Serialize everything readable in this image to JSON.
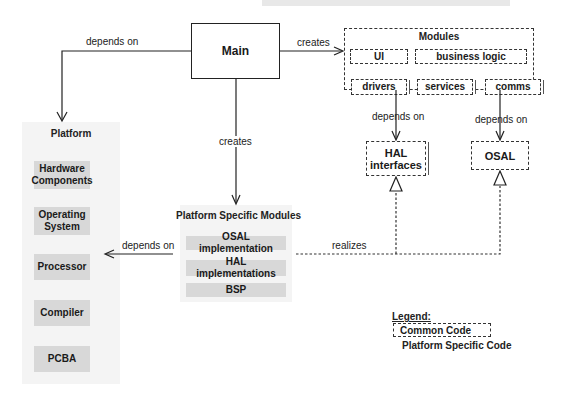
{
  "diagram": {
    "main": {
      "label": "Main"
    },
    "modules": {
      "title": "Modules",
      "items": [
        "UI",
        "business logic",
        "drivers",
        "services",
        "comms"
      ]
    },
    "hal_interfaces": {
      "label": "HAL\ninterfaces",
      "line1": "HAL",
      "line2": "interfaces"
    },
    "osal": {
      "label": "OSAL"
    },
    "platform": {
      "title": "Platform",
      "items": [
        {
          "line1": "Hardware",
          "line2": "Components"
        },
        {
          "line1": "Operating",
          "line2": "System"
        },
        {
          "line1": "Processor",
          "line2": ""
        },
        {
          "line1": "Compiler",
          "line2": ""
        },
        {
          "line1": "PCBA",
          "line2": ""
        }
      ]
    },
    "platform_specific": {
      "title": "Platform Specific Modules",
      "items": [
        "OSAL implementation",
        "HAL implementations",
        "BSP"
      ]
    },
    "edges": {
      "main_platform": "depends on",
      "main_modules": "creates",
      "main_psm": "creates",
      "psm_platform": "depends on",
      "modules_hal": "depends on",
      "modules_osal": "depends on",
      "realizes": "realizes"
    },
    "legend": {
      "title": "Legend:",
      "common": "Common Code",
      "platform_specific": "Platform Specific Code"
    }
  }
}
